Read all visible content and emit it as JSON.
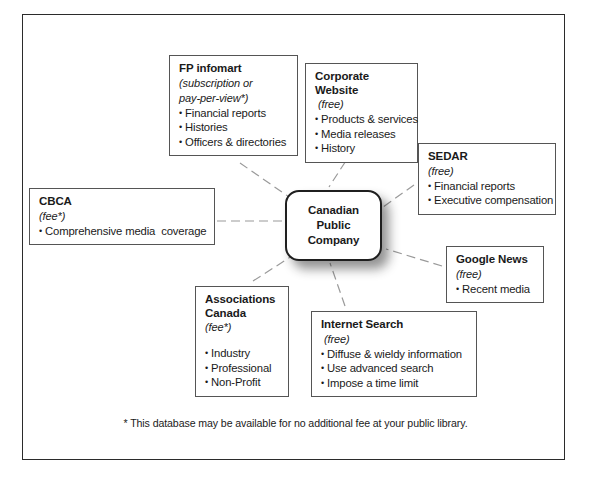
{
  "diagram": {
    "center": {
      "lines": [
        "Canadian",
        "Public",
        "Company"
      ]
    },
    "footnote": "* This database may be available for no additional fee at your public library.",
    "nodes": [
      {
        "id": "fp-infomart",
        "title": "FP infomart",
        "subtitle": "(subscription or",
        "subtitle2": "pay-per-view*)",
        "items": [
          "Financial reports",
          "Histories",
          "Officers & directories"
        ]
      },
      {
        "id": "corporate-website",
        "title": "Corporate Website",
        "subtitle": "(free)",
        "items": [
          "Products & services",
          "Media releases",
          "History"
        ]
      },
      {
        "id": "sedar",
        "title": "SEDAR",
        "subtitle": "(free)",
        "items": [
          "Financial reports",
          "Executive compensation"
        ]
      },
      {
        "id": "cbca",
        "title": "CBCA",
        "subtitle": "(fee*)",
        "items": [
          "Comprehensive media  coverage"
        ]
      },
      {
        "id": "google-news",
        "title": "Google News",
        "subtitle": "(free)",
        "items": [
          "Recent media"
        ]
      },
      {
        "id": "associations-canada",
        "title": "Associations\nCanada",
        "subtitle": "(fee*)",
        "items": [
          "Industry",
          "Professional",
          "Non-Profit"
        ]
      },
      {
        "id": "internet-search",
        "title": "Internet Search",
        "subtitle": "(free)",
        "items": [
          "Diffuse & wieldy information",
          "Use advanced search",
          "Impose a time limit"
        ]
      }
    ],
    "colors": {
      "frame_border": "#2b2b2b",
      "box_border": "#555555",
      "connector": "#9a9a9a",
      "center_border": "#1f1f1f",
      "text": "#1a1a1a",
      "background": "#ffffff"
    }
  }
}
